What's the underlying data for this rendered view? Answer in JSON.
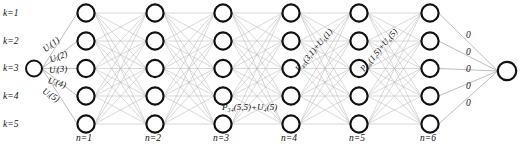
{
  "diagram": {
    "type": "layered-network",
    "colors": {
      "node_stroke": "#111111",
      "node_fill": "#ffffff",
      "edge": "#b9b9b9",
      "edge_highlight": "#a8a8a8",
      "text": "#111111",
      "background": "#ffffff"
    },
    "geometry": {
      "width": 521,
      "height": 148,
      "node_radius": 8.6,
      "source_radius": 8.0,
      "sink_radius": 9.2,
      "layer_x": [
        86,
        155,
        223,
        291,
        359,
        430
      ],
      "node_y": [
        13,
        41,
        68.5,
        96,
        124
      ],
      "source": {
        "x": 34,
        "y": 68.5
      },
      "sink": {
        "x": 507,
        "y": 71
      }
    }
  },
  "stage_labels": {
    "caption": "n",
    "items": [
      {
        "text": "n=1",
        "x": 76,
        "y": 134
      },
      {
        "text": "n=2",
        "x": 145,
        "y": 134
      },
      {
        "text": "n=3",
        "x": 213,
        "y": 134
      },
      {
        "text": "n=4",
        "x": 281,
        "y": 134
      },
      {
        "text": "n=5",
        "x": 349,
        "y": 134
      },
      {
        "text": "n=6",
        "x": 420,
        "y": 134
      }
    ]
  },
  "state_labels": {
    "caption": "k",
    "items": [
      {
        "text": "k=1",
        "x": 3,
        "y": 9
      },
      {
        "text": "k=2",
        "x": 3,
        "y": 37
      },
      {
        "text": "k=3",
        "x": 3,
        "y": 64
      },
      {
        "text": "k=4",
        "x": 3,
        "y": 92
      },
      {
        "text": "k=5",
        "x": 3,
        "y": 120
      }
    ]
  },
  "input_labels": {
    "items": [
      {
        "text": "Uᵢ(1)",
        "x": 44,
        "y": 46,
        "rot": -38
      },
      {
        "text": "Uᵢ(2)",
        "x": 50,
        "y": 56,
        "rot": -22
      },
      {
        "text": "Uᵢ(3)",
        "x": 49,
        "y": 66,
        "rot": -5
      },
      {
        "text": "Uᵢ(4)",
        "x": 48,
        "y": 76,
        "rot": 16
      },
      {
        "text": "Uᵢ(5)",
        "x": 43,
        "y": 86,
        "rot": 32
      }
    ]
  },
  "path_labels": {
    "items": [
      {
        "text": "P₃₄(5,5)+U₄(5)",
        "x": 222,
        "y": 103,
        "rot": 0,
        "style": "p-label"
      },
      {
        "text": "P₄₅(3,1)+U₅(1)",
        "x": 297,
        "y": 66,
        "rot": -50,
        "style": "p-rot"
      },
      {
        "text": "P₅₆(1,5)+U₆(5)",
        "x": 362,
        "y": 66,
        "rot": -50,
        "style": "p-rot"
      }
    ]
  },
  "terminal_labels": {
    "items": [
      {
        "text": "0",
        "x": 466,
        "y": 31
      },
      {
        "text": "0",
        "x": 466,
        "y": 48
      },
      {
        "text": "0",
        "x": 466,
        "y": 65
      },
      {
        "text": "0",
        "x": 466,
        "y": 82
      },
      {
        "text": "0",
        "x": 466,
        "y": 99
      }
    ]
  },
  "chart_data": {
    "type": "diagram",
    "layers": 6,
    "states_per_layer": 5,
    "source_state": 3,
    "edges_note": "fully connected between consecutive layers; source fans out to all 5 states of layer 1; all states of layer 6 converge to sink with metric 0"
  }
}
